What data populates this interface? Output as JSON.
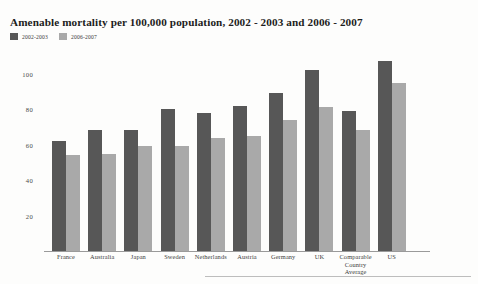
{
  "chart_data": {
    "type": "bar",
    "title": "Amenable mortality per 100,000 population, 2002 - 2003 and 2006 - 2007",
    "xlabel": "",
    "ylabel": "",
    "ylim": [
      0,
      110
    ],
    "grid": false,
    "legend_position": "top-left",
    "yticks": [
      20,
      40,
      60,
      80,
      100
    ],
    "ytick_labels": [
      "20",
      "40",
      "60",
      "80",
      "100"
    ],
    "categories": [
      "France",
      "Australia",
      "Japan",
      "Sweden",
      "Netherlands",
      "Austria",
      "Germany",
      "UK",
      "Comparable Country Average",
      "US"
    ],
    "series": [
      {
        "name": "2002-2003",
        "color": "#575757",
        "values": [
          62,
          68,
          68,
          80,
          78,
          82,
          89,
          102,
          79,
          107
        ]
      },
      {
        "name": "2006-2007",
        "color": "#a9a9a9",
        "values": [
          54,
          55,
          59,
          59,
          64,
          65,
          74,
          81,
          68,
          95
        ]
      }
    ]
  },
  "legend": {
    "entries": [
      {
        "label": "2002-2003",
        "color": "#575757"
      },
      {
        "label": "2006-2007",
        "color": "#a9a9a9"
      }
    ]
  }
}
